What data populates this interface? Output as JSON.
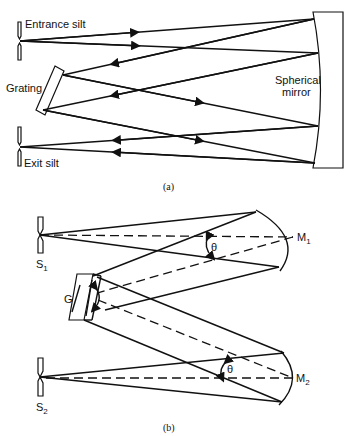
{
  "figure_a": {
    "caption": "(a)",
    "labels": {
      "entrance": "Entrance silt",
      "exit": "Exit silt",
      "grating": "Grating",
      "mirror_line1": "Spherical",
      "mirror_line2": "mirror"
    }
  },
  "figure_b": {
    "caption": "(b)",
    "labels": {
      "s1": "S",
      "s1_sub": "1",
      "s2": "S",
      "s2_sub": "2",
      "g": "G",
      "m1": "M",
      "m1_sub": "1",
      "m2": "M",
      "m2_sub": "2",
      "theta1": "θ",
      "theta2": "θ"
    }
  },
  "colors": {
    "line": "#111111",
    "background": "#ffffff"
  }
}
